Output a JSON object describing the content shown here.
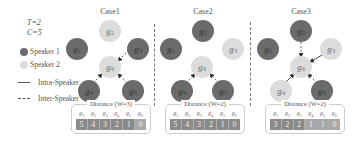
{
  "params": {
    "T": "T=2",
    "C": "C=5"
  },
  "legend": {
    "speaker1": {
      "label": "Speaker 1",
      "color": "#6b6b6b"
    },
    "speaker2": {
      "label": "Speaker 2",
      "color": "#dcdcdc"
    },
    "intra": {
      "label": "Intra-Speaker",
      "style": "solid"
    },
    "inter": {
      "label": "Inter-Speaker",
      "style": "dashed"
    }
  },
  "cases": [
    {
      "title": "Case1",
      "nodes": [
        {
          "id": "g2",
          "label": "g",
          "sub": "2",
          "speaker": 2
        },
        {
          "id": "g1",
          "label": "g",
          "sub": "1",
          "speaker": 1
        },
        {
          "id": "g3",
          "label": "g",
          "sub": "3",
          "speaker": 1
        },
        {
          "id": "g6",
          "label": "g",
          "sub": "6",
          "speaker": 2
        },
        {
          "id": "g4",
          "label": "g",
          "sub": "4",
          "speaker": 1
        },
        {
          "id": "g5",
          "label": "g",
          "sub": "5",
          "speaker": 1
        }
      ],
      "edges": [
        {
          "from": "g3",
          "to": "g6",
          "type": "inter"
        },
        {
          "from": "g4",
          "to": "g6",
          "type": "inter"
        },
        {
          "from": "g5",
          "to": "g6",
          "type": "inter"
        }
      ],
      "table": {
        "title": "Distance (W=3)",
        "headers": [
          {
            "g": "g",
            "s": "1"
          },
          {
            "g": "g",
            "s": "2"
          },
          {
            "g": "g",
            "s": "3"
          },
          {
            "g": "g",
            "s": "4"
          },
          {
            "g": "g",
            "s": "5"
          },
          {
            "g": "g",
            "s": "6"
          }
        ],
        "values": [
          "5",
          "4",
          "3",
          "2",
          "1",
          "0"
        ]
      }
    },
    {
      "title": "Case2",
      "nodes": [
        {
          "id": "g2",
          "label": "g",
          "sub": "2",
          "speaker": 1
        },
        {
          "id": "g1",
          "label": "g",
          "sub": "1",
          "speaker": 1
        },
        {
          "id": "g3",
          "label": "g",
          "sub": "3",
          "speaker": 2
        },
        {
          "id": "g6",
          "label": "g",
          "sub": "6",
          "speaker": 2
        },
        {
          "id": "g4",
          "label": "g",
          "sub": "4",
          "speaker": 1
        },
        {
          "id": "g5",
          "label": "g",
          "sub": "5",
          "speaker": 1
        }
      ],
      "edges": [
        {
          "from": "g4",
          "to": "g6",
          "type": "inter"
        },
        {
          "from": "g5",
          "to": "g6",
          "type": "inter"
        }
      ],
      "table": {
        "title": "Distance (W=2)",
        "headers": [
          {
            "g": "g",
            "s": "1"
          },
          {
            "g": "g",
            "s": "2"
          },
          {
            "g": "g",
            "s": "3"
          },
          {
            "g": "g",
            "s": "4"
          },
          {
            "g": "g",
            "s": "5"
          },
          {
            "g": "g",
            "s": "6"
          }
        ],
        "values": [
          "5",
          "4",
          "3",
          "2",
          "1",
          "0"
        ]
      }
    },
    {
      "title": "Case3",
      "nodes": [
        {
          "id": "g2",
          "label": "g",
          "sub": "2",
          "speaker": 1
        },
        {
          "id": "g1",
          "label": "g",
          "sub": "1",
          "speaker": 1
        },
        {
          "id": "g3",
          "label": "g",
          "sub": "3",
          "speaker": 2
        },
        {
          "id": "g6",
          "label": "g",
          "sub": "6",
          "speaker": 2
        },
        {
          "id": "g4",
          "label": "g",
          "sub": "4",
          "speaker": 2
        },
        {
          "id": "g5",
          "label": "g",
          "sub": "5",
          "speaker": 1
        }
      ],
      "edges": [
        {
          "from": "g2",
          "to": "g6",
          "type": "inter"
        },
        {
          "from": "g3",
          "to": "g6",
          "type": "intra"
        },
        {
          "from": "g4",
          "to": "g6",
          "type": "intra"
        },
        {
          "from": "g5",
          "to": "g6",
          "type": "inter"
        }
      ],
      "table": {
        "title": "Distance (W=2)",
        "headers": [
          {
            "g": "g",
            "s": "1"
          },
          {
            "g": "g",
            "s": "2"
          },
          {
            "g": "g",
            "s": "3"
          },
          {
            "g": "g",
            "s": "4"
          },
          {
            "g": "g",
            "s": "5"
          },
          {
            "g": "g",
            "s": "6"
          }
        ],
        "values": [
          "3",
          "2",
          "2",
          "1",
          "1",
          "0"
        ]
      }
    }
  ]
}
